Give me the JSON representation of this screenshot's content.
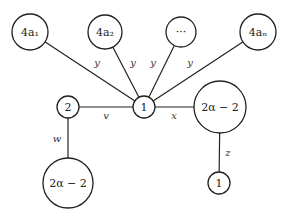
{
  "diagram": {
    "type": "graph",
    "nodes": [
      {
        "id": "a1",
        "label": "4a₁",
        "x": 30,
        "y": 32,
        "r": 18
      },
      {
        "id": "a2",
        "label": "4a₂",
        "x": 105,
        "y": 32,
        "r": 17
      },
      {
        "id": "dots",
        "label": "···",
        "x": 181,
        "y": 32,
        "r": 15
      },
      {
        "id": "an",
        "label": "4aₙ",
        "x": 258,
        "y": 32,
        "r": 18
      },
      {
        "id": "two",
        "label": "2",
        "x": 68,
        "y": 107,
        "r": 11
      },
      {
        "id": "center",
        "label": "1",
        "x": 144,
        "y": 107,
        "r": 11
      },
      {
        "id": "right",
        "label": "2α − 2",
        "x": 220,
        "y": 107,
        "r": 26
      },
      {
        "id": "bottomleft",
        "label": "2α − 2",
        "x": 68,
        "y": 183,
        "r": 25
      },
      {
        "id": "bottomright",
        "label": "1",
        "x": 219,
        "y": 183,
        "r": 11
      }
    ],
    "edges": [
      {
        "from": "a1",
        "to": "center",
        "label": "y",
        "lx": 97,
        "ly": 62
      },
      {
        "from": "a2",
        "to": "center",
        "label": "y",
        "lx": 133,
        "ly": 62
      },
      {
        "from": "dots",
        "to": "center",
        "label": "y",
        "lx": 153,
        "ly": 62
      },
      {
        "from": "an",
        "to": "center",
        "label": "y",
        "lx": 190,
        "ly": 62
      },
      {
        "from": "two",
        "to": "center",
        "label": "v",
        "lx": 106,
        "ly": 115
      },
      {
        "from": "center",
        "to": "right",
        "label": "x",
        "lx": 174,
        "ly": 115
      },
      {
        "from": "two",
        "to": "bottomleft",
        "label": "w",
        "lx": 57,
        "ly": 138
      },
      {
        "from": "right",
        "to": "bottomright",
        "label": "z",
        "lx": 228,
        "ly": 152
      }
    ]
  }
}
